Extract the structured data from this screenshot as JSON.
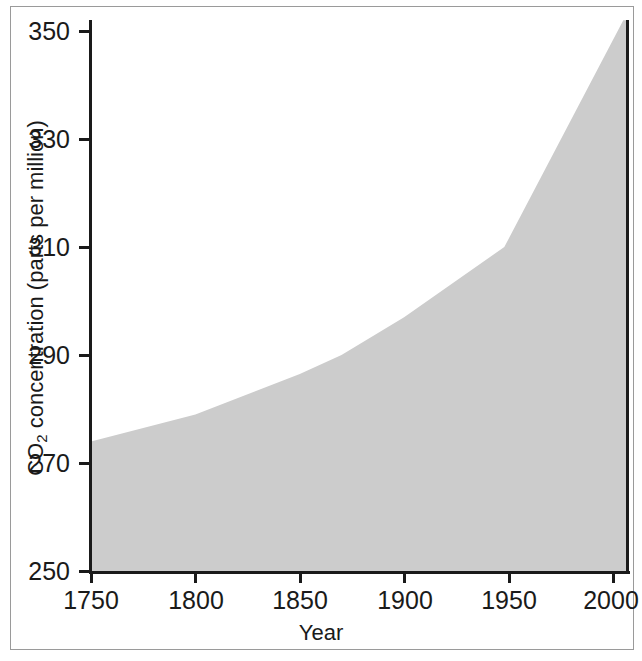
{
  "chart_data": {
    "type": "area",
    "title": "",
    "xlabel": "Year",
    "ylabel": "CO2 concentration (parts per million)",
    "ylabel_main": "CO",
    "ylabel_sub": "2",
    "ylabel_rest": " concentration (parts per million)",
    "xlim": [
      1742,
      2007
    ],
    "ylim": [
      250,
      352
    ],
    "grid": false,
    "legend": null,
    "fill_color": "#cccccc",
    "axis_color": "#1a1a1a",
    "background_color": "#ffffff",
    "x_ticks": [
      1750,
      1800,
      1850,
      1900,
      1950,
      2000
    ],
    "x_tick_labels": [
      "1750",
      "1800",
      "1850",
      "1900",
      "1950",
      "2000"
    ],
    "y_ticks": [
      250,
      270,
      290,
      310,
      330,
      350
    ],
    "y_tick_labels": [
      "250",
      "270",
      "290",
      "310",
      "330",
      "350"
    ],
    "series": [
      {
        "name": "CO2 concentration",
        "x": [
          1742,
          1750,
          1800,
          1850,
          1870,
          1900,
          1948,
          2005
        ],
        "values": [
          273.5,
          274,
          279,
          286.5,
          290,
          297,
          310,
          352
        ]
      }
    ],
    "points": [
      {
        "year": 1742,
        "co2": 273.5
      },
      {
        "year": 1750,
        "co2": 274
      },
      {
        "year": 1800,
        "co2": 279
      },
      {
        "year": 1850,
        "co2": 286.5
      },
      {
        "year": 1870,
        "co2": 290
      },
      {
        "year": 1900,
        "co2": 297
      },
      {
        "year": 1948,
        "co2": 310
      },
      {
        "year": 2005,
        "co2": 352
      }
    ]
  },
  "axes": {
    "x_title": "Year",
    "y_title_prefix": "CO",
    "y_title_subscript": "2",
    "y_title_suffix": " concentration (parts per million)",
    "x_tick_labels": [
      "1750",
      "1800",
      "1850",
      "1900",
      "1950",
      "2000"
    ],
    "y_tick_labels": [
      "350",
      "330",
      "310",
      "290",
      "270",
      "250"
    ]
  }
}
